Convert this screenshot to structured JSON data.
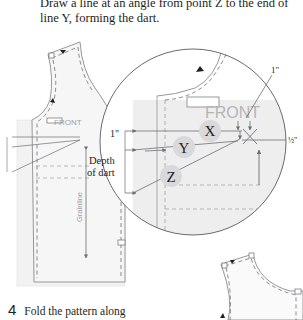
{
  "instruction": {
    "text": "Draw a line at an angle from point Z to the end of line Y, forming the dart."
  },
  "diagram": {
    "pattern_label": "FRONT",
    "grainline_label": "Grainline",
    "points": [
      "X",
      "Y",
      "Z"
    ],
    "measure_left": "1\"",
    "measure_top": "1\"",
    "measure_right": "½\"",
    "depth_label_line1": "Depth",
    "depth_label_line2": "of dart",
    "colors": {
      "pattern_fill": "#ebebeb",
      "point_circle": "#d9d9d9",
      "line": "#6d6e71",
      "front_text": "#9d9fa2"
    }
  },
  "step": {
    "number": "4",
    "text": "Fold the pattern along"
  }
}
